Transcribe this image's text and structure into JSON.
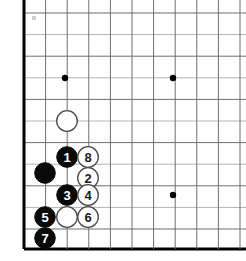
{
  "figure": {
    "kind": "go-board-diagram",
    "title": "",
    "board_size_visible_cols": 11,
    "board_size_visible_rows": 12,
    "colors": {
      "background": "#ffffff",
      "grid_line": "#6e6e6e",
      "grid_line_faint": "#b4b4b4",
      "board_edge": "#000000",
      "black_stone": "#0a0a0a",
      "white_stone": "#ffffff",
      "white_stone_outline": "#4a4a4a",
      "star_point": "#000000",
      "black_label_text": "#ffffff",
      "white_label_text": "#1a1a1a"
    }
  },
  "geometry": {
    "origin_x": 24,
    "origin_y": 13,
    "spacing": 21.6,
    "stone_radius": 10.3,
    "left_edge_x": 24,
    "bottom_edge_y": 249
  },
  "grid": {
    "vertical_lines_x": [
      24,
      45.6,
      67.2,
      88.8,
      110.4,
      132,
      153.6,
      175.2,
      196.8,
      218.4,
      240
    ],
    "horizontal_lines_y": [
      13,
      34.6,
      56.2,
      77.8,
      99.4,
      121,
      142.6,
      164.2,
      185.8,
      207.4,
      229,
      249
    ]
  },
  "star_points": [
    {
      "name": "star-point-upper-left",
      "x": 65,
      "y": 78
    },
    {
      "name": "star-point-upper-right",
      "x": 173,
      "y": 78
    },
    {
      "name": "star-point-lower-right",
      "x": 173,
      "y": 195
    }
  ],
  "corner_mark": {
    "name": "corner-mark",
    "x": 32,
    "y": 16,
    "width": 4,
    "height": 4
  },
  "stones": [
    {
      "id": "white-unnumbered-top",
      "color": "white",
      "label": "",
      "x": 67,
      "y": 121
    },
    {
      "id": "black-1",
      "color": "black",
      "label": "1",
      "x": 67,
      "y": 157
    },
    {
      "id": "white-8",
      "color": "white",
      "label": "8",
      "x": 88,
      "y": 157
    },
    {
      "id": "black-unnumbered-left",
      "color": "black",
      "label": "",
      "x": 45,
      "y": 173
    },
    {
      "id": "white-2",
      "color": "white",
      "label": "2",
      "x": 88,
      "y": 178
    },
    {
      "id": "black-3",
      "color": "black",
      "label": "3",
      "x": 67,
      "y": 195
    },
    {
      "id": "white-4",
      "color": "white",
      "label": "4",
      "x": 88,
      "y": 195
    },
    {
      "id": "black-5",
      "color": "black",
      "label": "5",
      "x": 45,
      "y": 217
    },
    {
      "id": "white-unnumbered-bottom",
      "color": "white",
      "label": "",
      "x": 67,
      "y": 217
    },
    {
      "id": "white-6",
      "color": "white",
      "label": "6",
      "x": 88,
      "y": 217
    },
    {
      "id": "black-7",
      "color": "black",
      "label": "7",
      "x": 45,
      "y": 238
    }
  ]
}
